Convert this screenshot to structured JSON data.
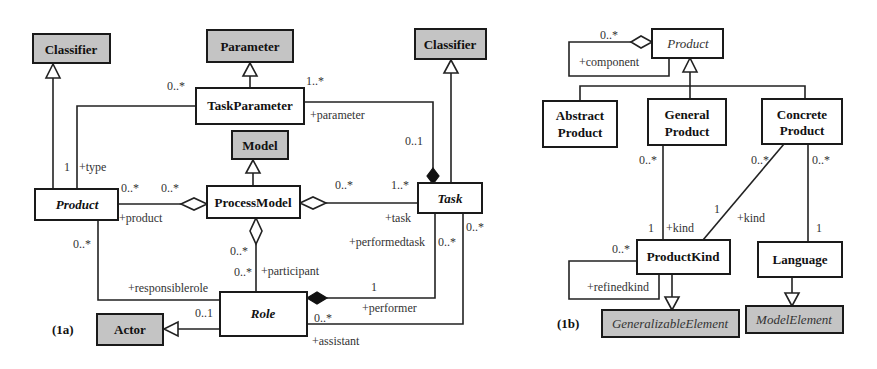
{
  "panels": {
    "a": {
      "label": "(1a)",
      "classes": {
        "classifier_left": "Classifier",
        "parameter": "Parameter",
        "task_parameter": "TaskParameter",
        "classifier_right": "Classifier",
        "model": "Model",
        "product": "Product",
        "process_model": "ProcessModel",
        "task": "Task",
        "role": "Role",
        "actor": "Actor"
      },
      "labels": {
        "tp_product_mult": "0..*",
        "tp_task_mult": "1..*",
        "tp_parameter_role": "+parameter",
        "task_param_mult": "0..1",
        "product_type_mult": "1",
        "product_type_role": "+type",
        "product_pm_mult1": "0..*",
        "product_pm_mult2": "0..*",
        "product_role_name": "+product",
        "pm_task_mult": "0..*",
        "task_pm_mult": "1..*",
        "task_role_name": "+task",
        "product_resp_mult": "0..*",
        "responsiblerole": "+responsiblerole",
        "resp_role_mult": "0..1",
        "pm_role_mult1": "0..*",
        "pm_role_mult2": "0..*",
        "participant": "+participant",
        "performedtask": "+performedtask",
        "performedtask_mult": "0..*",
        "performer_mult": "1",
        "performer": "+performer",
        "assist_task_mult": "0..*",
        "assist_role_mult": "0..*",
        "assistant": "+assistant"
      }
    },
    "b": {
      "label": "(1b)",
      "classes": {
        "product": "Product",
        "abstract_product_1": "Abstract",
        "abstract_product_2": "Product",
        "general_product_1": "General",
        "general_product_2": "Product",
        "concrete_product_1": "Concrete",
        "concrete_product_2": "Product",
        "product_kind": "ProductKind",
        "language": "Language",
        "generalizable_element": "GeneralizableElement",
        "model_element": "ModelElement"
      },
      "labels": {
        "component_mult": "0..*",
        "component": "+component",
        "gp_mult": "0..*",
        "cp_kind_mult": "0..*",
        "cp_lang_mult": "0..*",
        "gp_kind_one": "1",
        "gp_kind_role": "+kind",
        "cp_kind_one": "1",
        "cp_kind_role": "+kind",
        "lang_one": "1",
        "refined_mult": "0..*",
        "refinedkind": "+refinedkind"
      }
    }
  }
}
